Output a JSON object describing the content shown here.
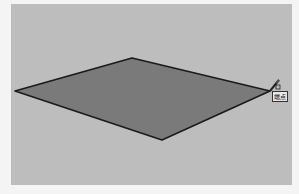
{
  "viewport": {
    "background": "#bdbdbd"
  },
  "shape": {
    "type": "face",
    "fill": "#7a7a7a",
    "edge_color": "#1a1a1a",
    "vertices": [
      [
        15,
        91
      ],
      [
        132,
        58
      ],
      [
        270,
        91
      ],
      [
        162,
        140
      ]
    ]
  },
  "cursor": {
    "tool": "pencil-icon",
    "position": [
      270,
      91
    ]
  },
  "inference_tooltip": {
    "label": "端点"
  }
}
